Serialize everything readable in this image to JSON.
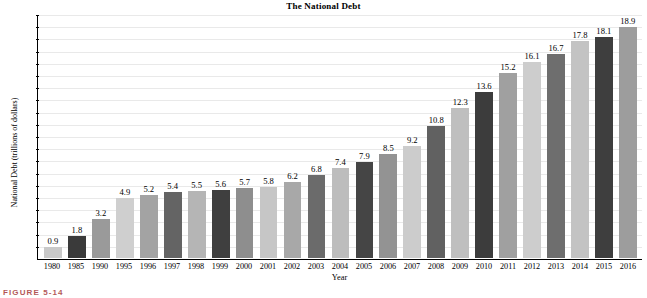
{
  "figure": {
    "caption": "FIGURE 5-14"
  },
  "chart_data": {
    "type": "bar",
    "title": "The National Debt",
    "xlabel": "Year",
    "ylabel": "National Debt (trillions of dollars)",
    "ylim": [
      0,
      20
    ],
    "ytick_step": 1,
    "grid": true,
    "legend": "none",
    "yticks": [
      20,
      19,
      18,
      17,
      16,
      15,
      14,
      13,
      12,
      11,
      10,
      9,
      8,
      7,
      6,
      5,
      4,
      3,
      2,
      1
    ],
    "categories": [
      "1980",
      "1985",
      "1990",
      "1995",
      "1996",
      "1997",
      "1998",
      "1999",
      "2000",
      "2001",
      "2002",
      "2003",
      "2004",
      "2005",
      "2006",
      "2007",
      "2008",
      "2009",
      "2010",
      "2011",
      "2012",
      "2013",
      "2014",
      "2015",
      "2016"
    ],
    "values": [
      0.9,
      1.8,
      3.2,
      4.9,
      5.2,
      5.4,
      5.5,
      5.6,
      5.7,
      5.8,
      6.2,
      6.8,
      7.4,
      7.9,
      8.5,
      9.2,
      10.8,
      12.3,
      13.6,
      15.2,
      16.1,
      16.7,
      17.8,
      18.1,
      18.9
    ],
    "data_labels": [
      "0.9",
      "1.8",
      "3.2",
      "4.9",
      "5.2",
      "5.4",
      "5.5",
      "5.6",
      "5.7",
      "5.8",
      "6.2",
      "6.8",
      "7.4",
      "7.9",
      "8.5",
      "9.2",
      "10.8",
      "12.3",
      "13.6",
      "15.2",
      "16.1",
      "16.7",
      "17.8",
      "18.1",
      "18.9"
    ],
    "bar_colors": [
      "#c9c9c9",
      "#3a3a3a",
      "#9a9a9a",
      "#cfcfcf",
      "#a3a3a3",
      "#646464",
      "#b5b5b5",
      "#3f3f3f",
      "#8e8e8e",
      "#c6c6c6",
      "#a8a8a8",
      "#6b6b6b",
      "#bdbdbd",
      "#454545",
      "#939393",
      "#cccccc",
      "#616161",
      "#bfbfbf",
      "#3c3c3c",
      "#a0a0a0",
      "#cdcdcd",
      "#6e6e6e",
      "#c3c3c3",
      "#3e3e3e",
      "#9d9d9d"
    ],
    "axis_color": "#000000",
    "grid_color": "#e9e9e9"
  }
}
